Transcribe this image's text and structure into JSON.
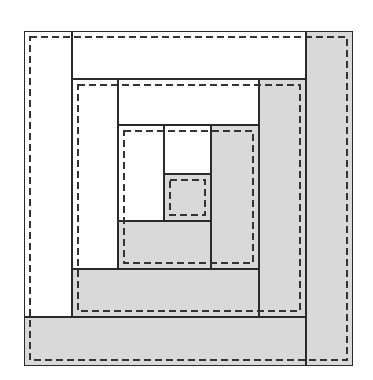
{
  "diagram": {
    "colors": {
      "light_fabric": "#ffffff",
      "dark_fabric": "#d9d9d9",
      "outline": "#2a2a2a",
      "seam_line": "#333333"
    },
    "pieces": [
      {
        "id": "ring1-left",
        "fabric": "light",
        "x": 24,
        "y": 31,
        "w": 48,
        "h": 286
      },
      {
        "id": "ring1-top",
        "fabric": "light",
        "x": 72,
        "y": 31,
        "w": 234,
        "h": 48
      },
      {
        "id": "ring1-right",
        "fabric": "dark",
        "x": 306,
        "y": 31,
        "w": 47,
        "h": 335
      },
      {
        "id": "ring1-bottom",
        "fabric": "dark",
        "x": 24,
        "y": 317,
        "w": 282,
        "h": 49
      },
      {
        "id": "ring2-left",
        "fabric": "light",
        "x": 72,
        "y": 79,
        "w": 46,
        "h": 190
      },
      {
        "id": "ring2-top",
        "fabric": "light",
        "x": 118,
        "y": 79,
        "w": 141,
        "h": 46
      },
      {
        "id": "ring2-right",
        "fabric": "dark",
        "x": 259,
        "y": 79,
        "w": 47,
        "h": 238
      },
      {
        "id": "ring2-bottom",
        "fabric": "dark",
        "x": 72,
        "y": 269,
        "w": 187,
        "h": 48
      },
      {
        "id": "ring3-left",
        "fabric": "light",
        "x": 118,
        "y": 125,
        "w": 46,
        "h": 96
      },
      {
        "id": "ring3-top",
        "fabric": "light",
        "x": 164,
        "y": 125,
        "w": 47,
        "h": 49
      },
      {
        "id": "ring3-right",
        "fabric": "dark",
        "x": 211,
        "y": 125,
        "w": 48,
        "h": 144
      },
      {
        "id": "ring3-bottom",
        "fabric": "dark",
        "x": 118,
        "y": 221,
        "w": 93,
        "h": 48
      },
      {
        "id": "center",
        "fabric": "dark",
        "x": 164,
        "y": 174,
        "w": 47,
        "h": 47
      }
    ],
    "seam_lines": [
      {
        "id": "seam-ring1",
        "x": 30,
        "y": 37,
        "w": 317,
        "h": 323
      },
      {
        "id": "seam-ring2",
        "x": 78,
        "y": 85,
        "w": 222,
        "h": 226
      },
      {
        "id": "seam-ring3",
        "x": 124,
        "y": 131,
        "w": 129,
        "h": 132
      },
      {
        "id": "seam-center",
        "x": 170,
        "y": 180,
        "w": 35,
        "h": 35
      }
    ],
    "seam_style": {
      "dash": 7,
      "gap": 4,
      "width": 2
    }
  }
}
